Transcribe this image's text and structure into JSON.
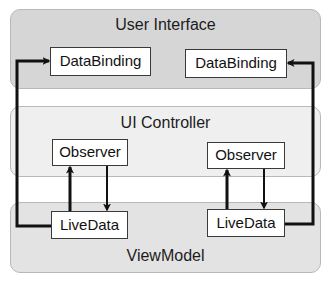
{
  "diagram": {
    "layers": {
      "ui": {
        "title": "User Interface",
        "fill": "#d6d6d6"
      },
      "controller": {
        "title": "UI Controller",
        "fill": "#efefef"
      },
      "viewmodel": {
        "title": "ViewModel",
        "fill": "#e3e3e3"
      }
    },
    "nodes": {
      "databinding_left": "DataBinding",
      "databinding_right": "DataBinding",
      "observer_left": "Observer",
      "observer_right": "Observer",
      "livedata_left": "LiveData",
      "livedata_right": "LiveData"
    },
    "edges": [
      {
        "from": "livedata_left",
        "to": "databinding_left",
        "style": "loop-left"
      },
      {
        "from": "livedata_right",
        "to": "databinding_right",
        "style": "loop-right"
      },
      {
        "from": "livedata_left",
        "to": "observer_left",
        "direction": "up"
      },
      {
        "from": "observer_left",
        "to": "livedata_left",
        "direction": "down"
      },
      {
        "from": "livedata_right",
        "to": "observer_right",
        "direction": "up"
      },
      {
        "from": "observer_right",
        "to": "livedata_right",
        "direction": "down"
      }
    ],
    "colors": {
      "line": "#111111",
      "node_border": "#3a3a3a",
      "layer_border": "#b8b8b8"
    }
  }
}
